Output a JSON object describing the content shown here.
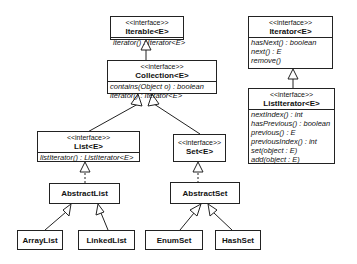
{
  "diagram": {
    "type": "UML class diagram",
    "stereotype": "<<interface>>",
    "nodes": {
      "iterable": {
        "name": "Iterable<E>",
        "ops": [
          "iterator() : Iterator<E>"
        ]
      },
      "collection": {
        "name": "Collection<E>",
        "ops": [
          "contains(Object o) : boolean",
          "iterator() : Iterator<E>"
        ]
      },
      "list": {
        "name": "List<E>",
        "ops": [
          "listIterator() : ListIterator<E>"
        ]
      },
      "set": {
        "name": "Set<E>"
      },
      "abstractlist": {
        "name": "AbstractList"
      },
      "abstractset": {
        "name": "AbstractSet"
      },
      "arraylist": {
        "name": "ArrayList"
      },
      "linkedlist": {
        "name": "LinkedList"
      },
      "enumset": {
        "name": "EnumSet"
      },
      "hashset": {
        "name": "HashSet"
      },
      "iterator": {
        "name": "Iterator<E>",
        "ops": [
          "hasNext() : boolean",
          "next() : E",
          "remove()"
        ]
      },
      "listiterator": {
        "name": "ListIterator<E>",
        "ops": [
          "nextIndex() : int",
          "hasPrevious() : boolean",
          "previous() : E",
          "previousIndex() : int",
          "set(object : E)",
          "add(object : E)"
        ]
      }
    },
    "edges": [
      {
        "from": "Collection<E>",
        "to": "Iterable<E>",
        "kind": "generalization"
      },
      {
        "from": "List<E>",
        "to": "Collection<E>",
        "kind": "generalization"
      },
      {
        "from": "Set<E>",
        "to": "Collection<E>",
        "kind": "generalization"
      },
      {
        "from": "AbstractList",
        "to": "List<E>",
        "kind": "realization"
      },
      {
        "from": "AbstractSet",
        "to": "Set<E>",
        "kind": "realization"
      },
      {
        "from": "ArrayList",
        "to": "AbstractList",
        "kind": "generalization"
      },
      {
        "from": "LinkedList",
        "to": "AbstractList",
        "kind": "generalization"
      },
      {
        "from": "EnumSet",
        "to": "AbstractSet",
        "kind": "generalization"
      },
      {
        "from": "HashSet",
        "to": "AbstractSet",
        "kind": "generalization"
      },
      {
        "from": "ListIterator<E>",
        "to": "Iterator<E>",
        "kind": "generalization"
      }
    ]
  }
}
